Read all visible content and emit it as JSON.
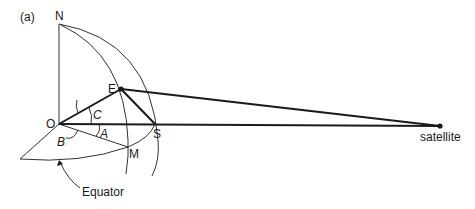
{
  "panel_label": "(a)",
  "points": {
    "N": {
      "label": "N",
      "x": 59,
      "y": 24
    },
    "E": {
      "label": "E",
      "x": 121,
      "y": 89
    },
    "O": {
      "label": "O",
      "x": 59,
      "y": 124
    },
    "S": {
      "label": "S",
      "x": 155,
      "y": 124
    },
    "M": {
      "label": "M",
      "x": 128,
      "y": 147
    },
    "satellite": {
      "label": "satellite",
      "x": 440,
      "y": 126
    }
  },
  "angles": {
    "A": "A",
    "B": "B",
    "C": "C"
  },
  "annotations": {
    "equator": "Equator"
  },
  "colors": {
    "line": "#1a1a1a",
    "background": "#ffffff"
  }
}
